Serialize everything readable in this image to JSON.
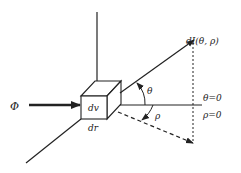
{
  "diagram": {
    "type": "radiometry-scattering-geometry",
    "labels": {
      "flux": "Φ",
      "volume_element": "dv",
      "path_element": "dr",
      "radiance": "dI(θ, ρ)",
      "polar_angle": "θ",
      "azimuth_angle": "ρ",
      "theta_zero": "θ=0",
      "rho_zero": "ρ=0"
    },
    "colors": {
      "stroke": "#222222",
      "background": "#ffffff"
    }
  }
}
